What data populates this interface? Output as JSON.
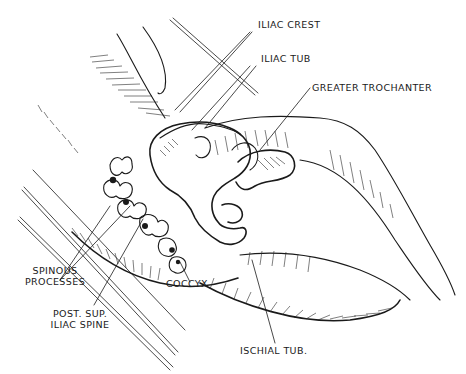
{
  "figure": {
    "type": "anatomical-illustration",
    "ink_color": "#1a1a1a",
    "background_color": "#ffffff"
  },
  "labels": {
    "iliac_crest": "ILIAC CREST",
    "iliac_tub": "ILIAC TUB",
    "greater_trochanter": "GREATER TROCHANTER",
    "spinous_processes_1": "SPINOUS",
    "spinous_processes_2": "PROCESSES",
    "coccyx": "COCCYX",
    "post_sup_1": "POST. SUP.",
    "post_sup_2": "ILIAC SPINE",
    "ischial_tub": "ISCHIAL TUB."
  }
}
